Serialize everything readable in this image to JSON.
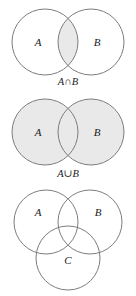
{
  "figure": {
    "name": "venn-diagrams-set-operations",
    "background_color": "#ffffff",
    "stroke_color": "#7d7d7d",
    "shade_color": "#e9e9e9",
    "text_color": "#1a1a1a",
    "width": 136,
    "height": 296
  },
  "diagrams": [
    {
      "id": "intersection",
      "caption": "A∩B",
      "caption_left": "A",
      "caption_operator": "∩",
      "caption_right": "B",
      "labels": [
        {
          "text": "A",
          "cx": 38,
          "cy": 46
        },
        {
          "text": "B",
          "cx": 97,
          "cy": 46
        }
      ],
      "circles": [
        {
          "name": "set-a",
          "cx": 45,
          "cy": 42,
          "r": 33,
          "shaded": false
        },
        {
          "name": "set-b",
          "cx": 91,
          "cy": 42,
          "r": 33,
          "shaded": false
        }
      ],
      "shaded_region": "intersection",
      "caption_x": 68,
      "caption_y": 85
    },
    {
      "id": "union",
      "caption": "A∪B",
      "caption_left": "A",
      "caption_operator": "∪",
      "caption_right": "B",
      "labels": [
        {
          "text": "A",
          "cx": 38,
          "cy": 136
        },
        {
          "text": "B",
          "cx": 97,
          "cy": 136
        }
      ],
      "circles": [
        {
          "name": "set-a",
          "cx": 45,
          "cy": 132,
          "r": 33,
          "shaded": true
        },
        {
          "name": "set-b",
          "cx": 91,
          "cy": 132,
          "r": 33,
          "shaded": true
        }
      ],
      "shaded_region": "union",
      "caption_x": 68,
      "caption_y": 177
    },
    {
      "id": "three-sets",
      "caption": "",
      "labels": [
        {
          "text": "A",
          "cx": 38,
          "cy": 216
        },
        {
          "text": "B",
          "cx": 98,
          "cy": 216
        },
        {
          "text": "C",
          "cx": 68,
          "cy": 264
        }
      ],
      "circles": [
        {
          "name": "set-a",
          "cx": 46,
          "cy": 222,
          "r": 32,
          "shaded": false
        },
        {
          "name": "set-b",
          "cx": 90,
          "cy": 222,
          "r": 32,
          "shaded": false
        },
        {
          "name": "set-c",
          "cx": 68,
          "cy": 258,
          "r": 32,
          "shaded": false
        }
      ],
      "shaded_region": "none"
    }
  ]
}
